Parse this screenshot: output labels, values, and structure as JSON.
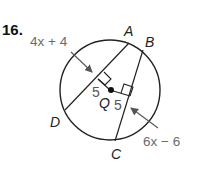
{
  "problem": {
    "number": "16."
  },
  "labels": {
    "expr_ad": "4x + 4",
    "expr_bc": "6x − 6",
    "dist_ad": "5",
    "dist_bc": "5",
    "center": "Q",
    "point_a": "A",
    "point_b": "B",
    "point_c": "C",
    "point_d": "D"
  },
  "colors": {
    "line": "#222222",
    "expression": "#6b6b6b",
    "arrow": "#555555"
  }
}
